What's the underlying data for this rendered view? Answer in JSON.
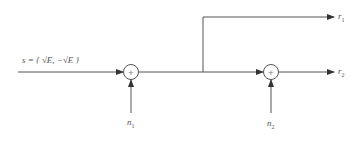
{
  "diagram": {
    "input": {
      "label": "s = { √E, −√E }"
    },
    "summers": [
      {
        "id": "summer-1",
        "symbol": "+",
        "noise": {
          "base": "n",
          "sub": "1"
        }
      },
      {
        "id": "summer-2",
        "symbol": "+",
        "noise": {
          "base": "n",
          "sub": "2"
        }
      }
    ],
    "outputs": [
      {
        "id": "r1",
        "base": "r",
        "sub": "1"
      },
      {
        "id": "r2",
        "base": "r",
        "sub": "2"
      }
    ],
    "colors": {
      "stroke": "#555555",
      "background": "#ffffff"
    }
  }
}
